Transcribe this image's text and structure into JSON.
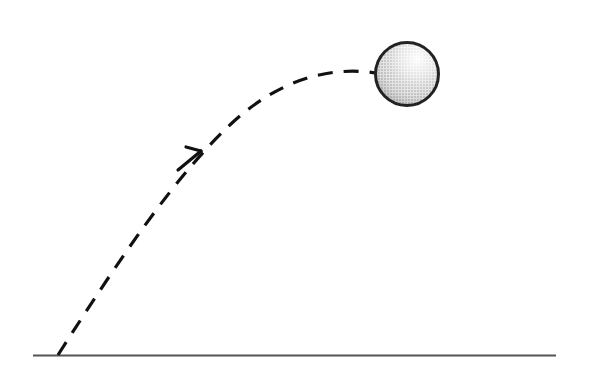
{
  "figure": {
    "background_color": "#ffffff",
    "width": 589,
    "height": 374
  },
  "ground": {
    "name": "ground-line",
    "color": "#555555",
    "thickness": 2,
    "x_start": 33,
    "x_end": 556,
    "y": 355.5
  },
  "trajectory": {
    "name": "dashed-trajectory-path",
    "color": "#111111",
    "thickness": 3.2,
    "dash_length": 15,
    "gap_length": 11,
    "launch_point": [
      58,
      355
    ],
    "apex_point": [
      338,
      67
    ],
    "end_point": [
      376,
      73
    ],
    "path": "M 58 355 C 120 258, 176 175, 232 123 C 280 79, 330 66, 376 73"
  },
  "arrow": {
    "name": "direction-arrowhead",
    "color": "#111111",
    "thickness": 3.2,
    "tip": [
      201,
      151
    ],
    "barb_left": [
      178,
      170
    ],
    "barb_right": [
      186,
      147
    ],
    "angle_degrees": 39
  },
  "ball": {
    "name": "projectile-ball",
    "center_x": 407,
    "center_y": 74,
    "radius": 31.5,
    "outline_color": "#222222",
    "outline_thickness": 3,
    "fill_light": "#f2f2f2",
    "fill_mid": "#d2d2d2",
    "fill_dark": "#9a9a9a",
    "highlight_x": 420,
    "highlight_y": 58,
    "texture": "halftone-dither"
  },
  "labels": {
    "ground_label": "",
    "ball_label": "",
    "trajectory_label": ""
  }
}
